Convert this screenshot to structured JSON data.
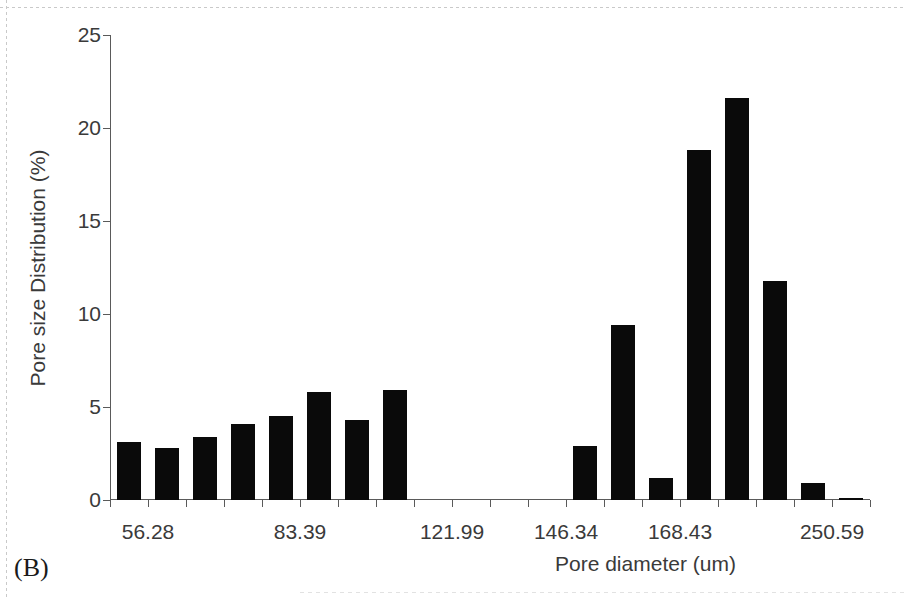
{
  "figure": {
    "panel_letter": "(B)",
    "background_color": "#ffffff",
    "bar_color": "#0a0a0a",
    "axis_color": "#5a5a5a"
  },
  "chart_data": {
    "type": "bar",
    "title": "",
    "xlabel": "Pore diameter (um)",
    "ylabel": "Pore size Distribution (%)",
    "ylim": [
      0,
      25
    ],
    "ytick_labels": [
      "0",
      "5",
      "10",
      "15",
      "20",
      "25"
    ],
    "ytick_values": [
      0,
      5,
      10,
      15,
      20,
      25
    ],
    "grid": false,
    "legend": null,
    "xtick_labels_shown": [
      "56.28",
      "83.39",
      "121.99",
      "146.34",
      "168.43",
      "250.59"
    ],
    "xtick_label_slots": [
      1,
      5,
      9,
      12,
      15,
      19
    ],
    "n_slots": 21,
    "categories": [
      "",
      "56.28",
      "",
      "",
      "",
      "83.39",
      "",
      "",
      "",
      "121.99",
      "",
      "",
      "146.34",
      "",
      "",
      "168.43",
      "",
      "",
      "",
      "250.59",
      ""
    ],
    "values": [
      0,
      3.1,
      2.8,
      3.4,
      4.1,
      4.5,
      5.8,
      4.3,
      5.9,
      0,
      0,
      0,
      0,
      2.9,
      9.4,
      1.2,
      18.8,
      21.6,
      11.8,
      0.9,
      0.1
    ],
    "bar_slots": [
      {
        "slot": 1,
        "value": 3.1
      },
      {
        "slot": 2,
        "value": 2.8
      },
      {
        "slot": 3,
        "value": 3.4
      },
      {
        "slot": 4,
        "value": 4.1
      },
      {
        "slot": 5,
        "value": 4.5
      },
      {
        "slot": 6,
        "value": 5.8
      },
      {
        "slot": 7,
        "value": 4.3
      },
      {
        "slot": 8,
        "value": 5.9
      },
      {
        "slot": 13,
        "value": 2.9
      },
      {
        "slot": 14,
        "value": 9.4
      },
      {
        "slot": 15,
        "value": 1.2
      },
      {
        "slot": 16,
        "value": 18.8
      },
      {
        "slot": 17,
        "value": 21.6
      },
      {
        "slot": 18,
        "value": 11.8
      },
      {
        "slot": 19,
        "value": 0.9
      },
      {
        "slot": 20,
        "value": 0.1
      }
    ]
  }
}
